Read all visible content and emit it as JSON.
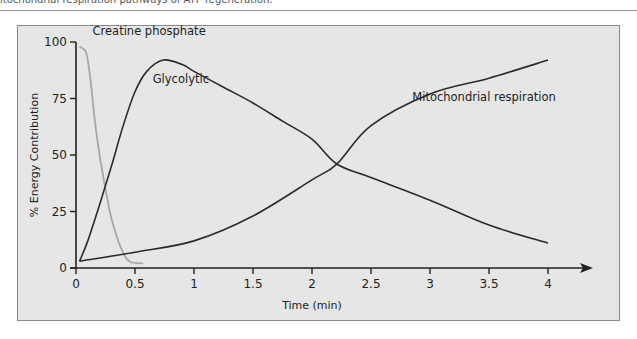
{
  "caption": "itochondrial respiration pathways of ATP regeneration.",
  "chart_data": {
    "type": "line",
    "title": "",
    "xlabel": "Time (min)",
    "ylabel": "% Energy Contribution",
    "xlim": [
      0,
      4
    ],
    "ylim": [
      0,
      100
    ],
    "xticks": [
      0,
      0.5,
      1,
      1.5,
      2,
      2.5,
      3,
      3.5,
      4
    ],
    "xtick_labels": [
      "0",
      "0.5",
      "1",
      "1.5",
      "2",
      "2.5",
      "3",
      "3.5",
      "4"
    ],
    "yticks": [
      0,
      25,
      50,
      75,
      100
    ],
    "ytick_labels": [
      "0",
      "25",
      "50",
      "75",
      "100"
    ],
    "grid": false,
    "legend": "inline labels",
    "series": [
      {
        "name": "Creatine phosphate",
        "color": "#a8a8a8",
        "x": [
          0.03,
          0.08,
          0.1,
          0.13,
          0.16,
          0.2,
          0.25,
          0.3,
          0.38,
          0.45,
          0.57
        ],
        "values": [
          98,
          96,
          92,
          80,
          65,
          50,
          35,
          22,
          9,
          3,
          2
        ]
      },
      {
        "name": "Glycolytic",
        "color": "#2b2b2b",
        "x": [
          0.03,
          0.1,
          0.2,
          0.3,
          0.4,
          0.5,
          0.6,
          0.74,
          0.9,
          1.0,
          1.25,
          1.5,
          1.75,
          2.0,
          2.21,
          2.5,
          3.0,
          3.5,
          4.0
        ],
        "values": [
          3,
          12,
          28,
          45,
          63,
          78,
          87,
          92,
          90,
          87,
          80,
          73,
          65,
          57,
          46,
          40,
          30,
          19,
          11
        ]
      },
      {
        "name": "Mitochondrial respiration",
        "color": "#2b2b2b",
        "x": [
          0.03,
          0.5,
          1.0,
          1.5,
          2.0,
          2.21,
          2.5,
          3.0,
          3.5,
          4.0
        ],
        "values": [
          3,
          7,
          12,
          23,
          39,
          46,
          63,
          77,
          84,
          92
        ]
      }
    ],
    "annotations": [
      {
        "text": "Creatine phosphate",
        "x": 0.14,
        "y": 103
      },
      {
        "text": "Glycolytic",
        "x": 0.65,
        "y": 82
      },
      {
        "text": "Mitochondrial respiration",
        "x": 2.85,
        "y": 74
      }
    ]
  }
}
